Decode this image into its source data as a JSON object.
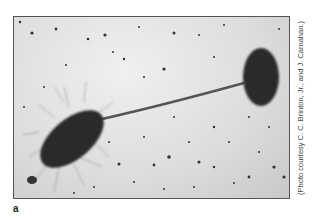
{
  "figure": {
    "panel_label": "a",
    "credit": "(Photo courtesy C. C. Brinton, Jr., and J. Carnahan.)",
    "image_description": "Electron micrograph of two bacterial cells connected by a long pilus; the left cell is covered in fine hair-like pili, the right cell is a smooth dark oval."
  }
}
